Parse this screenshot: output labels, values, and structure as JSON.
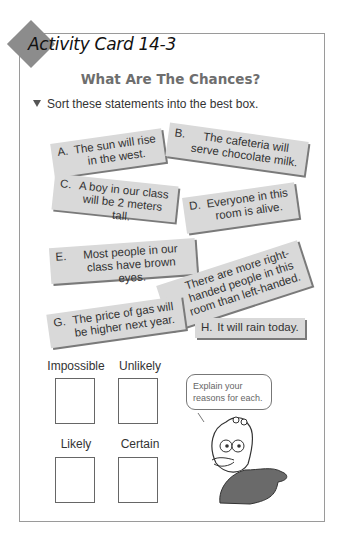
{
  "card": {
    "title": "Activity Card 14-3",
    "subtitle": "What Are The Chances?",
    "instruction": "Sort these statements into the best box."
  },
  "statements": [
    {
      "letter": "A.",
      "text": "The sun will rise in the west."
    },
    {
      "letter": "B.",
      "text": "The cafeteria will serve chocolate milk."
    },
    {
      "letter": "C.",
      "text": "A boy in our class will be 2 meters tall."
    },
    {
      "letter": "D.",
      "text": "Everyone in this room is alive."
    },
    {
      "letter": "E.",
      "text": "Most people in our class have brown eyes."
    },
    {
      "letter": "F.",
      "text": "There are more right-handed people in this room than left-handed."
    },
    {
      "letter": "G.",
      "text": "The price of gas will be higher next year."
    },
    {
      "letter": "H.",
      "text": "It will rain today."
    }
  ],
  "categories": [
    {
      "label": "Impossible"
    },
    {
      "label": "Unlikely"
    },
    {
      "label": "Likely"
    },
    {
      "label": "Certain"
    }
  ],
  "speech_bubble": {
    "text": "Explain your reasons for each."
  },
  "colors": {
    "strip": "#d9d9d9",
    "strip_shadow": "#7a7a7a",
    "diamond": "#8c8c8c",
    "subtitle": "#6e6e6e"
  }
}
